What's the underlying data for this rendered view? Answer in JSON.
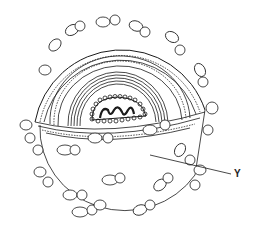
{
  "diagram": {
    "labels": [
      {
        "id": "Y",
        "text": "Y",
        "x": 233,
        "y": 170,
        "line": {
          "x1": 150,
          "y1": 155,
          "x2": 231,
          "y2": 174
        }
      }
    ],
    "colors": {
      "stroke": "#1a1a1a",
      "background": "#ffffff",
      "fill": "#ffffff"
    }
  }
}
